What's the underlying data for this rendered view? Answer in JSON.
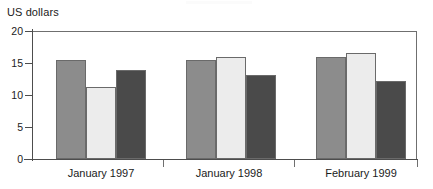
{
  "chart_data": {
    "type": "bar",
    "title": "",
    "subtitle": "",
    "ylabel": "US dollars",
    "xlabel": "",
    "categories": [
      "January 1997",
      "January 1998",
      "February 1999"
    ],
    "series": [
      {
        "name": "series-1",
        "color": "#8c8c8c",
        "values": [
          15.4,
          15.4,
          15.9
        ]
      },
      {
        "name": "series-2",
        "color": "#ececec",
        "values": [
          11.3,
          16.0,
          16.5
        ]
      },
      {
        "name": "series-3",
        "color": "#4a4a4a",
        "values": [
          13.9,
          13.2,
          12.2
        ]
      }
    ],
    "ylim": [
      0,
      20
    ],
    "yticks": [
      0,
      5,
      10,
      15,
      20
    ],
    "ytick_labels": [
      "0",
      "5",
      "10",
      "15",
      "20"
    ],
    "grid": false,
    "legend": "none"
  },
  "axis": {
    "y_title": "US dollars",
    "tick_0": "0",
    "tick_5": "5",
    "tick_10": "10",
    "tick_15": "15",
    "tick_20": "20"
  },
  "categories": {
    "group_1": "January 1997",
    "group_2": "January 1998",
    "group_3": "February 1999"
  }
}
